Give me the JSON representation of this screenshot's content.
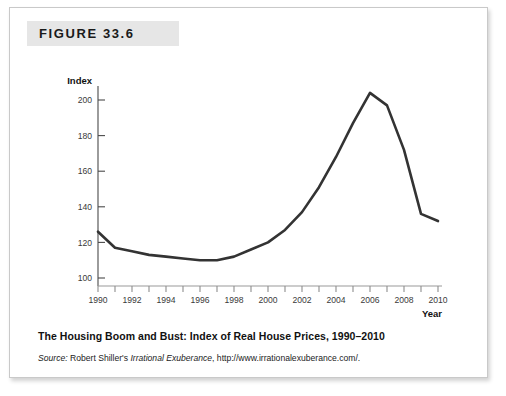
{
  "figure": {
    "header_label": "FIGURE 33.6",
    "caption_title": "The Housing Boom and Bust: Index of Real House Prices, 1990–2010",
    "source_prefix": "Source:",
    "source_author": " Robert Shiller's ",
    "source_book": "Irrational Exuberance",
    "source_url": ", http://www.irrationalexuberance.com/."
  },
  "chart_data": {
    "type": "line",
    "title": "The Housing Boom and Bust: Index of Real House Prices, 1990–2010",
    "xlabel": "Year",
    "ylabel": "Index",
    "xlim": [
      1990,
      2010
    ],
    "ylim": [
      90,
      210
    ],
    "grid": false,
    "legend": "none",
    "line_color": "#333333",
    "y_ticks": [
      100,
      120,
      140,
      160,
      180,
      200
    ],
    "y_tick_labels": [
      "100",
      "120",
      "140",
      "160",
      "180",
      "200"
    ],
    "x_ticks": [
      1990,
      1991,
      1992,
      1993,
      1994,
      1995,
      1996,
      1997,
      1998,
      1999,
      2000,
      2001,
      2002,
      2003,
      2004,
      2005,
      2006,
      2007,
      2008,
      2009,
      2010
    ],
    "x_tick_labels": [
      "1990",
      "",
      "1992",
      "",
      "1994",
      "",
      "1996",
      "",
      "1998",
      "",
      "2000",
      "",
      "2002",
      "",
      "2004",
      "",
      "2006",
      "",
      "2008",
      "",
      "2010"
    ],
    "x": [
      1990,
      1991,
      1992,
      1993,
      1994,
      1995,
      1996,
      1997,
      1998,
      1999,
      2000,
      2001,
      2002,
      2003,
      2004,
      2005,
      2006,
      2007,
      2008,
      2009,
      2010
    ],
    "values": [
      126,
      117,
      115,
      113,
      112,
      111,
      110,
      110,
      112,
      116,
      120,
      127,
      137,
      151,
      168,
      187,
      204,
      197,
      172,
      136,
      132
    ],
    "series": [
      {
        "name": "Index of Real House Prices",
        "values": [
          126,
          117,
          115,
          113,
          112,
          111,
          110,
          110,
          112,
          116,
          120,
          127,
          137,
          151,
          168,
          187,
          204,
          197,
          172,
          136,
          132
        ]
      }
    ]
  }
}
